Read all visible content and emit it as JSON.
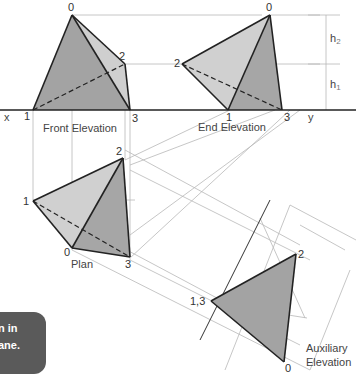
{
  "figure": {
    "views": {
      "front_elevation": "Front Elevation",
      "end_elevation": "End Elevation",
      "plan": "Plan",
      "auxiliary_line1": "Auxiliary",
      "auxiliary_line2": "Elevation"
    },
    "axis": {
      "x": "x",
      "y": "y"
    },
    "points": {
      "fe": {
        "p0": "0",
        "p1": "1",
        "p2": "2",
        "p3": "3"
      },
      "ee": {
        "p0": "0",
        "p1": "1",
        "p2": "2",
        "p3": "3"
      },
      "plan": {
        "p0": "0",
        "p1": "1",
        "p2": "2",
        "p3": "3"
      },
      "aux": {
        "p0": "0",
        "p13": "1,3",
        "p2": "2"
      }
    },
    "dimensions": {
      "h1": "h",
      "h1_sub": "1",
      "h2": "h",
      "h2_sub": "2"
    },
    "callout": {
      "line1": "n in",
      "line2": "ane."
    },
    "colors": {
      "dark_face": "#9a9a9a",
      "light_face": "#cfcfcf",
      "line": "#222222",
      "construction": "#b5b5b5"
    }
  }
}
